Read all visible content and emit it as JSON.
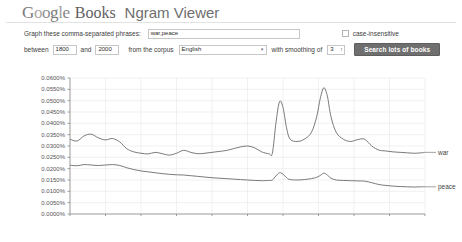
{
  "header": {
    "logo_letters": [
      "G",
      "o",
      "o",
      "g",
      "l",
      "e"
    ],
    "logo_books": "Books",
    "logo_ngram": "Ngram Viewer"
  },
  "form": {
    "phrases_label": "Graph these comma-separated phrases:",
    "phrases_value": "war,peace",
    "phrases_placeholder": "",
    "case_insensitive_label": "case-insensitive",
    "case_insensitive_checked": false,
    "between_label": "between",
    "year_start": "1800",
    "and_label": "and",
    "year_end": "2000",
    "corpus_label": "from the corpus",
    "corpus_value": "English",
    "smoothing_label": "with smoothing of",
    "smoothing_value": "3",
    "search_button": "Search lots of books",
    "caret_glyph": "▾",
    "spinner_glyph": "↕"
  },
  "chart_data": {
    "type": "line",
    "title": "",
    "xlabel": "",
    "ylabel": "",
    "xlim": [
      1800,
      2000
    ],
    "ylim": [
      0.0,
      0.06
    ],
    "grid": true,
    "legend_position": "right-inline",
    "x_ticks": [
      1800,
      1820,
      1840,
      1860,
      1880,
      1900,
      1920,
      1940,
      1960,
      1980,
      2000
    ],
    "y_ticks": [
      0.0,
      0.005,
      0.01,
      0.015,
      0.02,
      0.025,
      0.03,
      0.035,
      0.04,
      0.045,
      0.05,
      0.055,
      0.06
    ],
    "y_tick_labels": [
      "0.0000%",
      "0.0050%",
      "0.0100%",
      "0.0150%",
      "0.0200%",
      "0.0250%",
      "0.0300%",
      "0.0350%",
      "0.0400%",
      "0.0450%",
      "0.0500%",
      "0.0550%",
      "0.0600%"
    ],
    "x": [
      1800,
      1804,
      1808,
      1812,
      1816,
      1820,
      1824,
      1828,
      1832,
      1836,
      1840,
      1844,
      1848,
      1852,
      1856,
      1860,
      1864,
      1868,
      1872,
      1876,
      1880,
      1884,
      1888,
      1892,
      1896,
      1900,
      1904,
      1908,
      1912,
      1914,
      1916,
      1918,
      1920,
      1922,
      1924,
      1928,
      1932,
      1936,
      1939,
      1941,
      1943,
      1945,
      1947,
      1950,
      1954,
      1958,
      1962,
      1966,
      1970,
      1974,
      1978,
      1982,
      1986,
      1990,
      1994,
      1998,
      2000
    ],
    "series": [
      {
        "name": "war",
        "label": "war",
        "color": "#6b6b6b",
        "values": [
          0.033,
          0.0322,
          0.0345,
          0.0352,
          0.0336,
          0.0327,
          0.0333,
          0.0318,
          0.0288,
          0.0274,
          0.0268,
          0.0265,
          0.0272,
          0.0266,
          0.026,
          0.0268,
          0.0281,
          0.0272,
          0.0266,
          0.0268,
          0.0272,
          0.0276,
          0.028,
          0.0288,
          0.0296,
          0.03,
          0.0292,
          0.0274,
          0.0266,
          0.0268,
          0.04,
          0.0495,
          0.047,
          0.038,
          0.033,
          0.032,
          0.033,
          0.036,
          0.043,
          0.051,
          0.0557,
          0.052,
          0.043,
          0.036,
          0.033,
          0.032,
          0.0328,
          0.033,
          0.03,
          0.0282,
          0.0278,
          0.0274,
          0.0272,
          0.027,
          0.0268,
          0.027,
          0.0272
        ]
      },
      {
        "name": "peace",
        "label": "peace",
        "color": "#6b6b6b",
        "values": [
          0.0215,
          0.0213,
          0.0218,
          0.0216,
          0.0214,
          0.0216,
          0.0218,
          0.0214,
          0.0204,
          0.0196,
          0.019,
          0.0186,
          0.0182,
          0.0178,
          0.0175,
          0.0173,
          0.0172,
          0.0169,
          0.0166,
          0.0163,
          0.016,
          0.0158,
          0.0156,
          0.0154,
          0.0152,
          0.015,
          0.0148,
          0.0147,
          0.0148,
          0.015,
          0.0168,
          0.0182,
          0.0176,
          0.016,
          0.0152,
          0.015,
          0.0152,
          0.0156,
          0.0162,
          0.017,
          0.018,
          0.0172,
          0.0158,
          0.015,
          0.0148,
          0.0147,
          0.0146,
          0.0145,
          0.0138,
          0.013,
          0.0126,
          0.0123,
          0.0121,
          0.012,
          0.0119,
          0.012,
          0.012
        ]
      }
    ]
  }
}
